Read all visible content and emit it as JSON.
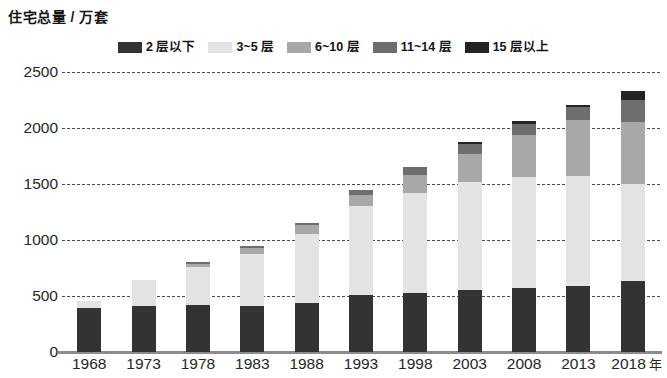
{
  "chart_data": {
    "type": "bar",
    "subtype": "stacked-bar",
    "title": "住宅总量 / 万套",
    "xlabel": "年",
    "ylabel": "住宅总量 / 万套",
    "ylim": [
      0,
      2500
    ],
    "ytick_step": 500,
    "yticks": [
      "0",
      "500",
      "1000",
      "1500",
      "2000",
      "2500"
    ],
    "grid": "horizontal-dashed",
    "legend_position": "top-center",
    "categories": [
      "1968",
      "1973",
      "1978",
      "1983",
      "1988",
      "1993",
      "1998",
      "2003",
      "2008",
      "2013",
      "2018"
    ],
    "series": [
      {
        "name": "2 层以下",
        "color": "#333333",
        "values": [
          390,
          410,
          420,
          415,
          440,
          510,
          530,
          555,
          575,
          590,
          630
        ]
      },
      {
        "name": "3~5 层",
        "color": "#e3e3e3",
        "values": [
          70,
          235,
          340,
          460,
          615,
          790,
          890,
          960,
          990,
          985,
          870
        ]
      },
      {
        "name": "6~10 层",
        "color": "#a8a8a8",
        "values": [
          0,
          0,
          30,
          50,
          75,
          100,
          165,
          250,
          375,
          495,
          550
        ]
      },
      {
        "name": "11~14 层",
        "color": "#6e6e6e",
        "values": [
          0,
          0,
          15,
          20,
          25,
          45,
          70,
          90,
          100,
          115,
          200
        ]
      },
      {
        "name": "15 层以上",
        "color": "#232323",
        "values": [
          0,
          0,
          0,
          0,
          0,
          0,
          0,
          20,
          20,
          25,
          80
        ]
      }
    ],
    "totals": [
      460,
      645,
      805,
      945,
      1155,
      1445,
      1655,
      1875,
      2060,
      2210,
      2330
    ]
  }
}
